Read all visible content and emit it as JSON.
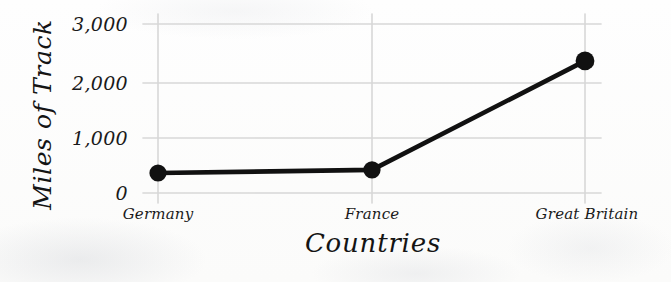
{
  "chart_data": {
    "type": "line",
    "title": "",
    "xlabel": "Countries",
    "ylabel": "Miles of Track",
    "categories": [
      "Germany",
      "France",
      "Great Britain"
    ],
    "values": [
      355,
      410,
      2345
    ],
    "series": [
      {
        "name": "Miles of Track",
        "values": [
          355,
          410,
          2345
        ]
      }
    ],
    "ylim": [
      0,
      3000
    ],
    "ytick_labels": [
      "0",
      "1,000",
      "2,000",
      "3,000"
    ],
    "ytick_values": [
      0,
      1000,
      2000,
      3000
    ],
    "grid": true,
    "legend": "none",
    "style": "hand-drawn",
    "line_color": "#111111",
    "marker_color": "#111111",
    "grid_color": "#d7d7d7",
    "background_color": "#fcfcfb"
  },
  "axes": {
    "y_title": "Miles of Track",
    "x_title": "Countries",
    "y_ticks": [
      {
        "label": "3,000",
        "value": 3000
      },
      {
        "label": "2,000",
        "value": 2000
      },
      {
        "label": "1,000",
        "value": 1000
      },
      {
        "label": "0",
        "value": 0
      }
    ],
    "x_ticks": [
      {
        "label": "Germany",
        "value": 355
      },
      {
        "label": "France",
        "value": 410
      },
      {
        "label": "Great Britain",
        "value": 2345
      }
    ]
  }
}
